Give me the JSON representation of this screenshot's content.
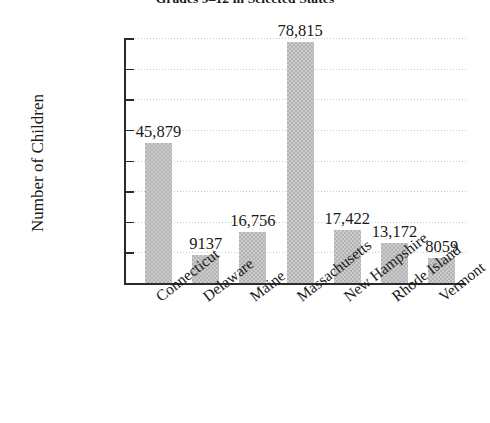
{
  "chart_data": {
    "type": "bar",
    "title": "Grades 9–12 in Selected States",
    "xlabel": "",
    "ylabel": "Number of Children",
    "categories": [
      "Connecticut",
      "Delaware",
      "Maine",
      "Massachusetts",
      "New Hampshire",
      "Rhode Island",
      "Vermont"
    ],
    "values": [
      45879,
      9137,
      16756,
      78815,
      17422,
      13172,
      8059
    ],
    "value_labels": [
      "45,879",
      "9137",
      "16,756",
      "78,815",
      "17,422",
      "13,172",
      "8059"
    ],
    "ylim": [
      0,
      80000
    ],
    "ytick_values": [
      0,
      10000,
      20000,
      30000,
      40000,
      50000,
      60000,
      70000,
      80000
    ],
    "ytick_labels": [
      "0",
      "10,000",
      "20,000",
      "30,000",
      "40,000",
      "50,000",
      "60,000",
      "70,000",
      "80,000"
    ],
    "grid": true,
    "grid_axis": "y",
    "legend": false,
    "bar_color": "#b4b4b4",
    "axis_color": "#2a2a2a",
    "gridline_color": "#c9c9c9",
    "xtick_label_rotation": -38
  }
}
